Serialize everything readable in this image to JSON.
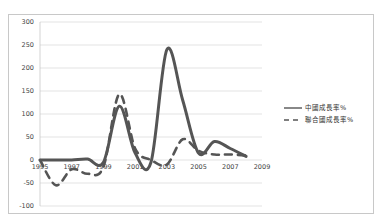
{
  "chart_data": {
    "type": "line",
    "title": "",
    "xlabel": "",
    "ylabel": "",
    "x": [
      1995,
      1996,
      1997,
      1998,
      1999,
      2000,
      2001,
      2002,
      2003,
      2004,
      2005,
      2006,
      2007,
      2008
    ],
    "series": [
      {
        "name": "中國成長率%",
        "style": "solid",
        "color": "#555555",
        "values": [
          0,
          0,
          0,
          2,
          -5,
          117,
          15,
          -5,
          240,
          130,
          15,
          40,
          25,
          8
        ]
      },
      {
        "name": "聯合國成長率%",
        "style": "dashed",
        "color": "#555555",
        "values": [
          0,
          -55,
          -20,
          -30,
          -15,
          143,
          25,
          0,
          -10,
          45,
          20,
          12,
          12,
          10
        ]
      }
    ],
    "xticks": [
      "1995",
      "1997",
      "1999",
      "2001",
      "2003",
      "2005",
      "2007",
      "2009"
    ],
    "yticks": [
      "300",
      "250",
      "200",
      "150",
      "100",
      "50",
      "0",
      "-50",
      "-100"
    ],
    "xlim": [
      1995,
      2009
    ],
    "ylim": [
      -100,
      300
    ],
    "grid": true,
    "legend_position": "right"
  }
}
